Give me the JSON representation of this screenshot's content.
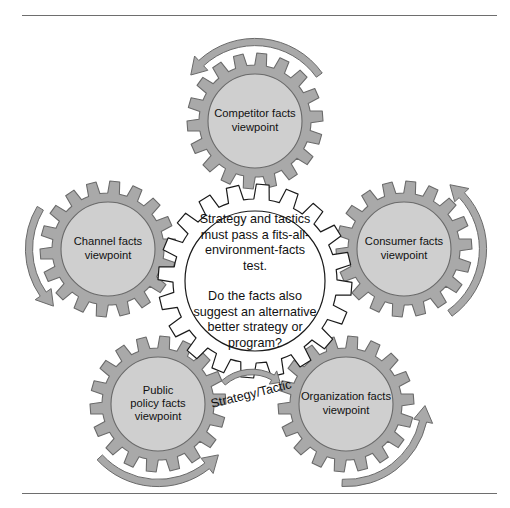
{
  "figure": {
    "type": "cycle-gear-diagram",
    "colors": {
      "gear_rim": "#a9a9a9",
      "gear_rim_stroke": "#6a6a6a",
      "gear_hub": "#cfcfcf",
      "gear_hub_stroke": "#6a6a6a",
      "center_gear_fill": "#ffffff",
      "center_gear_stroke": "#1a1a1a",
      "arrow_fill": "#a9a9a9",
      "arrow_stroke": "#6a6a6a",
      "text": "#111111",
      "rule": "#6e6e6e",
      "background": "#ffffff"
    },
    "rules": {
      "top_label": "top-divider-rule",
      "bottom_label": "bottom-divider-rule"
    }
  },
  "center_gear": {
    "name": "strategy-test-hub",
    "teeth": 20,
    "lines": [
      "Strategy and tactics",
      "must pass a fits-all-",
      "environment-facts",
      "test.",
      "",
      "Do the facts also",
      "suggest an alternative",
      "better strategy or",
      "program?"
    ],
    "paragraph_1": "Strategy and tactics must pass a fits-all-environment-facts test.",
    "paragraph_2": "Do the facts also suggest an alternative better strategy or program?"
  },
  "flow_label": {
    "text": "Strategy/Tactic",
    "rotation_deg": -14
  },
  "outer_gears": [
    {
      "id": "competitor",
      "lines": [
        "Competitor facts",
        "viewpoint"
      ],
      "full_label": "Competitor facts viewpoint",
      "position": "top",
      "cx": 255,
      "cy": 121,
      "teeth": 18,
      "arrow_direction": "counterclockwise"
    },
    {
      "id": "consumer",
      "lines": [
        "Consumer facts",
        "viewpoint"
      ],
      "full_label": "Consumer facts viewpoint",
      "position": "right",
      "cx": 404,
      "cy": 249,
      "teeth": 18,
      "arrow_direction": "counterclockwise"
    },
    {
      "id": "organization",
      "lines": [
        "Organization facts",
        "viewpoint"
      ],
      "full_label": "Organization facts viewpoint",
      "position": "bottom-right",
      "cx": 346,
      "cy": 404,
      "teeth": 18,
      "arrow_direction": "counterclockwise"
    },
    {
      "id": "public-policy",
      "lines": [
        "Public",
        "policy facts",
        "viewpoint"
      ],
      "full_label": "Public policy facts viewpoint",
      "position": "bottom-left",
      "cx": 158,
      "cy": 404,
      "teeth": 18,
      "arrow_direction": "clockwise"
    },
    {
      "id": "channel",
      "lines": [
        "Channel facts",
        "viewpoint"
      ],
      "full_label": "Channel facts viewpoint",
      "position": "left",
      "cx": 108,
      "cy": 249,
      "teeth": 18,
      "arrow_direction": "clockwise"
    }
  ]
}
